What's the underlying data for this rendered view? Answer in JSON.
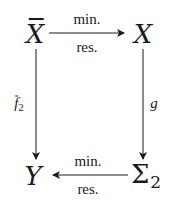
{
  "diagram": {
    "type": "commutative-square",
    "nodes": {
      "top_left": {
        "symbol": "X",
        "overline": true,
        "subscript": ""
      },
      "top_right": {
        "symbol": "X",
        "overline": false,
        "subscript": ""
      },
      "bottom_left": {
        "symbol": "Y",
        "overline": false,
        "subscript": ""
      },
      "bottom_right": {
        "symbol": "Σ",
        "overline": false,
        "subscript": "2"
      }
    },
    "arrows": {
      "top": {
        "from": "top_left",
        "to": "top_right",
        "label_above": "min.",
        "label_below": "res."
      },
      "bottom": {
        "from": "bottom_right",
        "to": "bottom_left",
        "label_above": "min.",
        "label_below": "res."
      },
      "left": {
        "from": "top_left",
        "to": "bottom_left",
        "label": "f",
        "label_overline": true,
        "label_subscript": "2"
      },
      "right": {
        "from": "top_right",
        "to": "bottom_right",
        "label": "g"
      }
    },
    "stroke_color": "#1a1a1a",
    "background": "#ffffff"
  }
}
